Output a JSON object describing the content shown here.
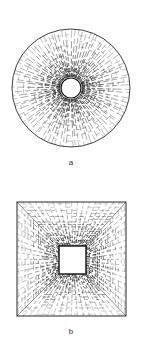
{
  "figures": [
    {
      "id": "a",
      "label": "a",
      "shape": "circle",
      "description": "Circular mesh with radial and concentric hatch lines, dense near central circular hole",
      "outer": {
        "cx": 71,
        "cy": 88,
        "r": 59
      },
      "inner": {
        "cx": 71,
        "cy": 88,
        "r": 10
      },
      "label_pos": {
        "x": 71,
        "y": 163
      }
    },
    {
      "id": "b",
      "label": "b",
      "shape": "square",
      "description": "Square mesh with hatch lines converging toward a central square opening, diagonals to corners",
      "outer": {
        "x": 17,
        "y": 202,
        "w": 109,
        "h": 114
      },
      "inner": {
        "x": 59,
        "y": 246,
        "w": 27,
        "h": 28
      },
      "label_pos": {
        "x": 71,
        "y": 332
      }
    }
  ],
  "colors": {
    "ink": "#111111",
    "background": "#ffffff",
    "label": "#333333"
  }
}
